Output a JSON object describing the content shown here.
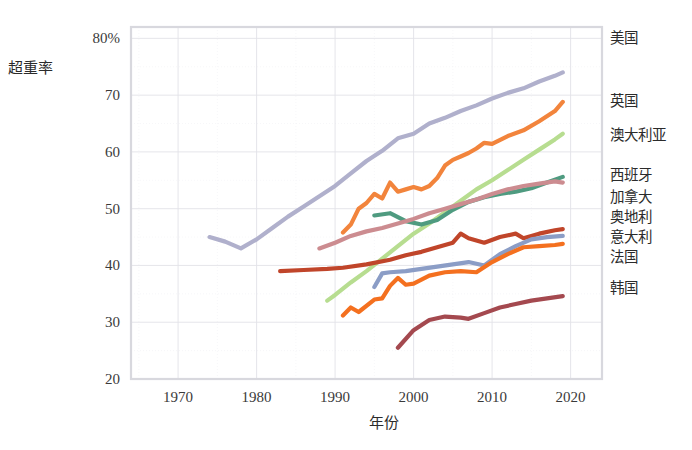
{
  "chart_data": {
    "type": "line",
    "title": "",
    "xlabel": "年份",
    "ylabel": "超重率",
    "xlim": [
      1964,
      2024
    ],
    "ylim": [
      20,
      82
    ],
    "grid": true,
    "legend_position": "right",
    "x_ticks": [
      "1970",
      "1980",
      "1990",
      "2000",
      "2010",
      "2020"
    ],
    "x_tick_values": [
      1970,
      1980,
      1990,
      2000,
      2010,
      2020
    ],
    "y_ticks": [
      "80%",
      "70",
      "60",
      "50",
      "40",
      "30",
      "20"
    ],
    "y_tick_values": [
      80,
      70,
      60,
      50,
      40,
      30,
      20
    ],
    "series": [
      {
        "name": "美国",
        "color": "#b0b0cc",
        "label_y": 80,
        "points": [
          [
            1974,
            45.0
          ],
          [
            1976,
            44.2
          ],
          [
            1978,
            43.0
          ],
          [
            1980,
            44.6
          ],
          [
            1982,
            46.6
          ],
          [
            1984,
            48.6
          ],
          [
            1986,
            50.4
          ],
          [
            1988,
            52.2
          ],
          [
            1990,
            54.0
          ],
          [
            1992,
            56.2
          ],
          [
            1994,
            58.4
          ],
          [
            1996,
            60.2
          ],
          [
            1998,
            62.4
          ],
          [
            2000,
            63.2
          ],
          [
            2002,
            65.0
          ],
          [
            2004,
            66.0
          ],
          [
            2006,
            67.2
          ],
          [
            2008,
            68.2
          ],
          [
            2010,
            69.4
          ],
          [
            2012,
            70.4
          ],
          [
            2014,
            71.2
          ],
          [
            2016,
            72.4
          ],
          [
            2018,
            73.4
          ],
          [
            2019,
            74.0
          ]
        ]
      },
      {
        "name": "英国",
        "color": "#f2843c",
        "label_y": 69,
        "points": [
          [
            1991,
            45.8
          ],
          [
            1992,
            47.2
          ],
          [
            1993,
            50.0
          ],
          [
            1994,
            51.0
          ],
          [
            1995,
            52.6
          ],
          [
            1996,
            51.8
          ],
          [
            1997,
            54.6
          ],
          [
            1998,
            53.0
          ],
          [
            1999,
            53.4
          ],
          [
            2000,
            53.8
          ],
          [
            2001,
            53.4
          ],
          [
            2002,
            54.0
          ],
          [
            2003,
            55.4
          ],
          [
            2004,
            57.6
          ],
          [
            2005,
            58.6
          ],
          [
            2006,
            59.2
          ],
          [
            2007,
            59.8
          ],
          [
            2008,
            60.6
          ],
          [
            2009,
            61.6
          ],
          [
            2010,
            61.4
          ],
          [
            2012,
            62.8
          ],
          [
            2014,
            63.8
          ],
          [
            2016,
            65.4
          ],
          [
            2018,
            67.2
          ],
          [
            2019,
            68.8
          ]
        ]
      },
      {
        "name": "澳大利亚",
        "color": "#b7dd90",
        "label_y": 63,
        "points": [
          [
            1989,
            33.8
          ],
          [
            1990,
            34.8
          ],
          [
            1992,
            37.0
          ],
          [
            1994,
            39.0
          ],
          [
            1996,
            41.2
          ],
          [
            1998,
            43.4
          ],
          [
            2000,
            45.6
          ],
          [
            2002,
            47.4
          ],
          [
            2004,
            49.4
          ],
          [
            2006,
            51.4
          ],
          [
            2008,
            53.4
          ],
          [
            2010,
            55.0
          ],
          [
            2012,
            56.8
          ],
          [
            2014,
            58.6
          ],
          [
            2016,
            60.4
          ],
          [
            2018,
            62.2
          ],
          [
            2019,
            63.2
          ]
        ]
      },
      {
        "name": "西班牙",
        "color": "#4f9b80",
        "label_y": 56,
        "points": [
          [
            1995,
            48.8
          ],
          [
            1997,
            49.2
          ],
          [
            1999,
            47.8
          ],
          [
            2001,
            47.2
          ],
          [
            2003,
            48.0
          ],
          [
            2005,
            49.8
          ],
          [
            2007,
            51.2
          ],
          [
            2009,
            52.0
          ],
          [
            2011,
            52.6
          ],
          [
            2013,
            53.0
          ],
          [
            2015,
            53.6
          ],
          [
            2017,
            54.6
          ],
          [
            2019,
            55.6
          ]
        ]
      },
      {
        "name": "加拿大",
        "color": "#cc8c90",
        "label_y": 52,
        "points": [
          [
            1988,
            43.0
          ],
          [
            1990,
            44.0
          ],
          [
            1992,
            45.2
          ],
          [
            1994,
            46.0
          ],
          [
            1996,
            46.6
          ],
          [
            1998,
            47.4
          ],
          [
            2000,
            48.2
          ],
          [
            2002,
            49.2
          ],
          [
            2004,
            50.0
          ],
          [
            2006,
            50.8
          ],
          [
            2008,
            51.6
          ],
          [
            2010,
            52.6
          ],
          [
            2012,
            53.4
          ],
          [
            2014,
            54.0
          ],
          [
            2016,
            54.4
          ],
          [
            2018,
            54.8
          ],
          [
            2019,
            54.6
          ]
        ]
      },
      {
        "name": "奥地利",
        "color": "#c0452a",
        "label_y": 48.5,
        "points": [
          [
            1983,
            39.0
          ],
          [
            1986,
            39.2
          ],
          [
            1989,
            39.4
          ],
          [
            1991,
            39.6
          ],
          [
            1994,
            40.2
          ],
          [
            1997,
            41.0
          ],
          [
            1999,
            41.8
          ],
          [
            2001,
            42.4
          ],
          [
            2003,
            43.2
          ],
          [
            2005,
            44.0
          ],
          [
            2006,
            45.6
          ],
          [
            2007,
            44.8
          ],
          [
            2009,
            44.0
          ],
          [
            2011,
            45.0
          ],
          [
            2013,
            45.6
          ],
          [
            2014,
            44.8
          ],
          [
            2016,
            45.6
          ],
          [
            2018,
            46.2
          ],
          [
            2019,
            46.4
          ]
        ]
      },
      {
        "name": "意大利",
        "color": "#8b9dc6",
        "label_y": 45,
        "points": [
          [
            1995,
            36.2
          ],
          [
            1996,
            38.6
          ],
          [
            1997,
            38.8
          ],
          [
            1999,
            39.0
          ],
          [
            2001,
            39.4
          ],
          [
            2003,
            39.8
          ],
          [
            2005,
            40.2
          ],
          [
            2007,
            40.6
          ],
          [
            2009,
            40.0
          ],
          [
            2011,
            42.0
          ],
          [
            2013,
            43.4
          ],
          [
            2015,
            44.6
          ],
          [
            2017,
            45.0
          ],
          [
            2019,
            45.2
          ]
        ]
      },
      {
        "name": "法国",
        "color": "#f4701f",
        "label_y": 41.5,
        "points": [
          [
            1991,
            31.2
          ],
          [
            1992,
            32.6
          ],
          [
            1993,
            31.8
          ],
          [
            1995,
            34.0
          ],
          [
            1996,
            34.2
          ],
          [
            1997,
            36.4
          ],
          [
            1998,
            37.8
          ],
          [
            1999,
            36.6
          ],
          [
            2000,
            36.8
          ],
          [
            2002,
            38.2
          ],
          [
            2004,
            38.8
          ],
          [
            2006,
            39.0
          ],
          [
            2008,
            38.8
          ],
          [
            2010,
            40.6
          ],
          [
            2012,
            42.0
          ],
          [
            2014,
            43.2
          ],
          [
            2016,
            43.4
          ],
          [
            2018,
            43.6
          ],
          [
            2019,
            43.8
          ]
        ]
      },
      {
        "name": "韩国",
        "color": "#a4494f",
        "label_y": 36,
        "points": [
          [
            1998,
            25.5
          ],
          [
            2000,
            28.6
          ],
          [
            2002,
            30.4
          ],
          [
            2004,
            31.0
          ],
          [
            2006,
            30.8
          ],
          [
            2007,
            30.6
          ],
          [
            2009,
            31.6
          ],
          [
            2011,
            32.6
          ],
          [
            2013,
            33.2
          ],
          [
            2015,
            33.8
          ],
          [
            2017,
            34.2
          ],
          [
            2019,
            34.6
          ]
        ]
      }
    ]
  }
}
